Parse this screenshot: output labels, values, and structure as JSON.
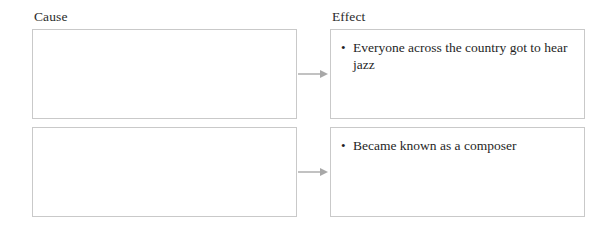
{
  "organizer": {
    "type": "cause-and-effect-graphic-organizer",
    "columns": {
      "cause_heading": "Cause",
      "effect_heading": "Effect"
    },
    "connector_icon": "right-arrow-icon",
    "bullet_glyph": "•",
    "colors": {
      "box_border": "#c9c9c9",
      "box_fill": "#ffffff",
      "text": "#1f1f1f",
      "arrow": "#a6a6a6",
      "page_background": "#ffffff"
    },
    "rows": [
      {
        "cause": {
          "filled": false,
          "text": ""
        },
        "effect": {
          "filled": true,
          "bullets": [
            "Everyone across the country got to hear jazz"
          ]
        }
      },
      {
        "cause": {
          "filled": false,
          "text": ""
        },
        "effect": {
          "filled": true,
          "bullets": [
            "Became known as a composer"
          ]
        }
      }
    ]
  }
}
